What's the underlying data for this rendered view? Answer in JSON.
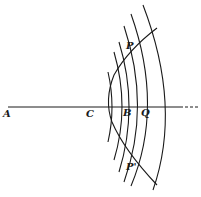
{
  "diagram": {
    "labels": {
      "A": "A",
      "C": "C",
      "B": "B",
      "Q": "Q",
      "P": "P",
      "P_prime": "P'"
    },
    "colors": {
      "ink": "#1a1a1a",
      "background": "#ffffff"
    }
  }
}
